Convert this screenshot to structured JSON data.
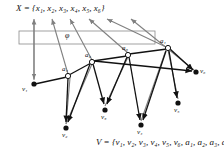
{
  "figure": {
    "type": "graph-diagram",
    "top_label": "X = {x₁, x₂, x₃, x₄, x₅, x₆}",
    "bottom_label": "V = {v₁, v₂, v₃, v₄, v₅, v₆, a₁, a₂, a₃, a₄}",
    "mapping_label": "φ",
    "colors": {
      "mapping_edge": "#808080",
      "tree_edge": "#111111",
      "node_fill_terminal": "#111111",
      "node_fill_internal": "#ffffff",
      "box_stroke": "#808080",
      "background": "#ffffff"
    },
    "box": {
      "x": 19,
      "y": 31,
      "width": 136,
      "height": 13
    },
    "x_labels": [
      {
        "name": "x1",
        "text": "x₁"
      },
      {
        "name": "x2",
        "text": "x₂"
      },
      {
        "name": "x3",
        "text": "x₃"
      },
      {
        "name": "x4",
        "text": "x₄"
      },
      {
        "name": "x5",
        "text": "x₅"
      },
      {
        "name": "x6",
        "text": "x₆"
      }
    ],
    "nodes": [
      {
        "id": "v1",
        "label": "v₁",
        "x": 34,
        "y": 84,
        "kind": "terminal",
        "lx": 22,
        "ly": 86
      },
      {
        "id": "v2",
        "label": "v₂",
        "x": 66,
        "y": 128,
        "kind": "terminal",
        "lx": 62,
        "ly": 132
      },
      {
        "id": "v3",
        "label": "v₃",
        "x": 105,
        "y": 110,
        "kind": "terminal",
        "lx": 101,
        "ly": 114
      },
      {
        "id": "v4",
        "label": "v₄",
        "x": 141,
        "y": 125,
        "kind": "terminal",
        "lx": 137,
        "ly": 129
      },
      {
        "id": "v5",
        "label": "v₅",
        "x": 178,
        "y": 103,
        "kind": "terminal",
        "lx": 174,
        "ly": 107
      },
      {
        "id": "v6",
        "label": "v₆",
        "x": 196,
        "y": 72,
        "kind": "terminal",
        "lx": 200,
        "ly": 70
      },
      {
        "id": "a1",
        "label": "a₁",
        "x": 168,
        "y": 48,
        "kind": "internal",
        "lx": 160,
        "ly": 40
      },
      {
        "id": "a2",
        "label": "a₂",
        "x": 92,
        "y": 62,
        "kind": "internal",
        "lx": 85,
        "ly": 54
      },
      {
        "id": "a3",
        "label": "a₃",
        "x": 128,
        "y": 55,
        "kind": "internal",
        "lx": 122,
        "ly": 47
      },
      {
        "id": "a4",
        "label": "a₄",
        "x": 68,
        "y": 76,
        "kind": "internal",
        "lx": 62,
        "ly": 68
      }
    ],
    "tree_edges": [
      {
        "from": "v1",
        "to": "a4"
      },
      {
        "from": "a4",
        "to": "a2"
      },
      {
        "from": "a2",
        "to": "a3"
      },
      {
        "from": "a3",
        "to": "a1"
      },
      {
        "from": "a4",
        "to": "v2",
        "arrow": true
      },
      {
        "from": "a2",
        "to": "v2",
        "arrow": true
      },
      {
        "from": "a2",
        "to": "v3",
        "arrow": true
      },
      {
        "from": "a3",
        "to": "v3",
        "arrow": true
      },
      {
        "from": "a3",
        "to": "v4",
        "arrow": true
      },
      {
        "from": "a1",
        "to": "v4",
        "arrow": true
      },
      {
        "from": "a1",
        "to": "v5",
        "arrow": true
      },
      {
        "from": "a1",
        "to": "v6",
        "arrow": true
      },
      {
        "from": "a2",
        "to": "v6",
        "arrow": true
      }
    ],
    "mapping_edges": [
      {
        "from": "v1",
        "to_label": "x1",
        "tipx": 34,
        "tipy": 18
      },
      {
        "from": "a4",
        "to_label": "x2",
        "tipx": 52,
        "tipy": 18
      },
      {
        "from": "a2",
        "to_label": "x3",
        "tipx": 70,
        "tipy": 18
      },
      {
        "from": "a3",
        "to_label": "x4",
        "tipx": 88,
        "tipy": 18
      },
      {
        "from": "a1",
        "to_label": "x5",
        "tipx": 106,
        "tipy": 18
      },
      {
        "from": "v6",
        "to_label": "x6",
        "tipx": 130,
        "tipy": 18
      },
      {
        "from": "v1",
        "to_label": "x1-down",
        "tipx": 34,
        "tipy": 80,
        "reverse": true
      }
    ]
  }
}
